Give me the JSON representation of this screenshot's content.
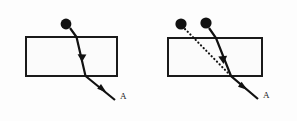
{
  "figure": {
    "background_color": "#fdfdfd",
    "ink_color": "#111111",
    "width": 297,
    "height": 121,
    "panels": [
      {
        "id": "panel-left",
        "name": "single-ray-panel",
        "slab": {
          "x": 26,
          "y": 37,
          "width": 91,
          "height": 39
        },
        "sources": [
          {
            "id": "source-a",
            "label": "",
            "cx": 66,
            "cy": 24,
            "r": 5.4
          }
        ],
        "rays": [
          {
            "id": "ray-incident-refracted",
            "style": "solid",
            "points": "70,28 76.5,37 85.5,76 115,100",
            "arrows": [
              {
                "x": 82,
                "y": 58,
                "angle": 77
              },
              {
                "x": 103,
                "y": 90,
                "angle": 39
              }
            ]
          }
        ],
        "labels": [
          {
            "id": "label-A-left",
            "text": "A",
            "x": 120,
            "y": 99
          }
        ]
      },
      {
        "id": "panel-right",
        "name": "two-source-panel",
        "slab": {
          "x": 168,
          "y": 38,
          "width": 94,
          "height": 38
        },
        "sources": [
          {
            "id": "source-b",
            "label": "",
            "cx": 181,
            "cy": 24,
            "r": 5.6
          },
          {
            "id": "source-c",
            "label": "",
            "cx": 206,
            "cy": 23,
            "r": 5.6
          }
        ],
        "rays": [
          {
            "id": "ray-reference-dotted",
            "style": "dotted",
            "points": "185,29 231,76",
            "arrows": []
          },
          {
            "id": "ray-incident-refracted-right",
            "style": "solid",
            "points": "209,28 216,38 231,76 258,99",
            "arrows": [
              {
                "x": 222.5,
                "y": 60,
                "angle": 68
              },
              {
                "x": 244,
                "y": 87,
                "angle": 40
              }
            ]
          }
        ],
        "labels": [
          {
            "id": "label-A-right",
            "text": "A",
            "x": 263,
            "y": 98
          }
        ]
      }
    ]
  }
}
